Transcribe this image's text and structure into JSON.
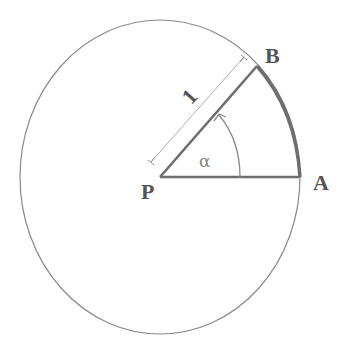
{
  "diagram": {
    "labels": {
      "center": "P",
      "point_a": "A",
      "point_b": "B",
      "radius": "1",
      "angle": "α"
    },
    "colors": {
      "line": "#8a8a8a",
      "thick": "#6e6e6e",
      "text": "#555555"
    },
    "geometry_semantics": {
      "radius_value": 1,
      "angle_description": "angle α from PA to PB, measured counter-clockwise"
    }
  }
}
